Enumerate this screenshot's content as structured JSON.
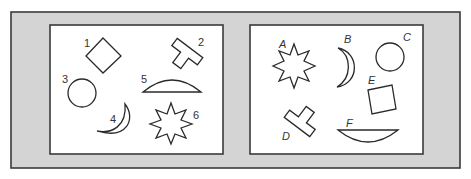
{
  "figure": {
    "colors": {
      "frame_fill": "#d4d4d4",
      "frame_stroke": "#3a3a3a",
      "panel_fill": "#ffffff",
      "shape_stroke": "#2a2a2a",
      "label_color": "#333333"
    },
    "left_panel": {
      "shapes": [
        {
          "label": "1",
          "shape": "diamond"
        },
        {
          "label": "2",
          "shape": "t-shape"
        },
        {
          "label": "3",
          "shape": "circle"
        },
        {
          "label": "4",
          "shape": "crescent"
        },
        {
          "label": "5",
          "shape": "arc-segment"
        },
        {
          "label": "6",
          "shape": "eight-point-star"
        }
      ]
    },
    "right_panel": {
      "shapes": [
        {
          "label": "A",
          "shape": "eight-point-star"
        },
        {
          "label": "B",
          "shape": "crescent"
        },
        {
          "label": "C",
          "shape": "circle"
        },
        {
          "label": "D",
          "shape": "t-shape"
        },
        {
          "label": "E",
          "shape": "square"
        },
        {
          "label": "F",
          "shape": "arc-segment"
        }
      ]
    }
  }
}
